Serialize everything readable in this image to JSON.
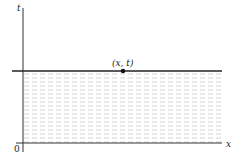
{
  "diagram": {
    "axes": {
      "x_label": "x",
      "y_label": "t",
      "origin_label": "0"
    },
    "horizontal_line": {
      "description": "line at height t"
    },
    "point": {
      "label": "(x, t)"
    },
    "shaded_region": {
      "description": "region between x-axis and line at height t",
      "fill_color": "#d8d8d8"
    },
    "colors": {
      "axis": "#333333",
      "line": "#222222",
      "point": "#111111"
    }
  }
}
